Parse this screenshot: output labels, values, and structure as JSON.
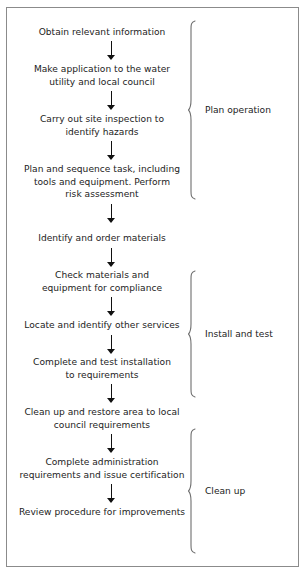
{
  "diagram": {
    "border_color": "#8b8b8b",
    "text_color": "#1c1c1c",
    "arrow_color": "#111111",
    "background": "#ffffff",
    "steps": [
      {
        "id": "step-1",
        "text": "Obtain relevant information"
      },
      {
        "id": "step-2",
        "text": "Make application to the water\nutility and local council"
      },
      {
        "id": "step-3",
        "text": "Carry out site inspection to\nidentify hazards"
      },
      {
        "id": "step-4",
        "text": "Plan and sequence task, including\ntools and equipment. Perform\nrisk assessment"
      },
      {
        "id": "step-5",
        "text": "Identify and order materials"
      },
      {
        "id": "step-6",
        "text": "Check materials and\nequipment for compliance"
      },
      {
        "id": "step-7",
        "text": "Locate and identify other services"
      },
      {
        "id": "step-8",
        "text": "Complete and test installation\nto requirements"
      },
      {
        "id": "step-9",
        "text": "Clean up and restore area to local\ncouncil requirements"
      },
      {
        "id": "step-10",
        "text": "Complete administration\nrequirements and issue certification"
      },
      {
        "id": "step-11",
        "text": "Review procedure for improvements"
      }
    ],
    "phases": [
      {
        "id": "phase-plan",
        "label": "Plan operation"
      },
      {
        "id": "phase-install",
        "label": "Install and test"
      },
      {
        "id": "phase-cleanup",
        "label": "Clean up"
      }
    ]
  }
}
